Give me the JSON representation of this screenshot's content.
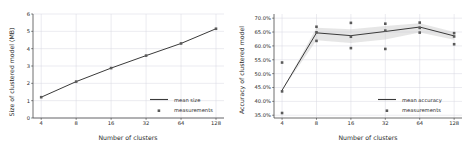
{
  "figure": {
    "background": "#ffffff",
    "line_color": "#3a3a3a",
    "marker_color": "#5a5a5a",
    "grid_color": "#d6d6e0",
    "axis_color": "#4a4a4a",
    "band_color": "#c8c8c8"
  },
  "chart_data": [
    {
      "type": "line",
      "id": "size-chart",
      "title": "",
      "xlabel": "Number of clusters",
      "ylabel": "Size of clustered model (MB)",
      "x": [
        4,
        8,
        16,
        32,
        64,
        128
      ],
      "xtick_labels": [
        "4",
        "8",
        "16",
        "32",
        "64",
        "128"
      ],
      "xscale": "log2",
      "xlim": [
        3.4,
        150
      ],
      "ylim": [
        0,
        6
      ],
      "ytick_labels": [
        "0",
        "1",
        "2",
        "3",
        "4",
        "5",
        "6"
      ],
      "ytick_values": [
        0,
        1,
        2,
        3,
        4,
        5,
        6
      ],
      "grid": true,
      "legend_position": "lower right",
      "series": [
        {
          "name": "mean size",
          "style": "line",
          "values": [
            1.2,
            2.1,
            2.88,
            3.6,
            4.3,
            5.15
          ]
        },
        {
          "name": "measurements",
          "style": "scatter",
          "values": [
            1.2,
            2.1,
            2.88,
            3.6,
            4.3,
            5.15
          ]
        }
      ]
    },
    {
      "type": "line",
      "id": "accuracy-chart",
      "title": "",
      "xlabel": "Number of clusters",
      "ylabel": "Accuracy of clustered model",
      "x": [
        4,
        8,
        16,
        32,
        64,
        128
      ],
      "xtick_labels": [
        "4",
        "8",
        "16",
        "32",
        "64",
        "128"
      ],
      "xscale": "log2",
      "xlim": [
        3.4,
        150
      ],
      "ylim": [
        34.0,
        71.5
      ],
      "ytick_labels": [
        "35.0%",
        "40.0%",
        "45.0%",
        "50.0%",
        "55.0%",
        "60.0%",
        "65.0%",
        "70.0%"
      ],
      "ytick_values": [
        35,
        40,
        45,
        50,
        55,
        60,
        65,
        70
      ],
      "grid": true,
      "legend_position": "lower right",
      "series": [
        {
          "name": "mean accuracy",
          "style": "line",
          "values": [
            44.0,
            64.7,
            63.7,
            65.2,
            66.8,
            63.6
          ]
        },
        {
          "name": "measurements",
          "style": "scatter",
          "points": [
            {
              "x": 4,
              "y": 35.8
            },
            {
              "x": 4,
              "y": 43.6
            },
            {
              "x": 4,
              "y": 54.0
            },
            {
              "x": 8,
              "y": 61.8
            },
            {
              "x": 8,
              "y": 64.9
            },
            {
              "x": 8,
              "y": 66.9
            },
            {
              "x": 16,
              "y": 59.2
            },
            {
              "x": 16,
              "y": 63.3
            },
            {
              "x": 16,
              "y": 68.3
            },
            {
              "x": 32,
              "y": 58.9
            },
            {
              "x": 32,
              "y": 65.5
            },
            {
              "x": 32,
              "y": 68.0
            },
            {
              "x": 64,
              "y": 64.8
            },
            {
              "x": 64,
              "y": 66.5
            },
            {
              "x": 64,
              "y": 68.4
            },
            {
              "x": 128,
              "y": 60.6
            },
            {
              "x": 128,
              "y": 63.4
            },
            {
              "x": 128,
              "y": 64.6
            }
          ]
        }
      ],
      "band": {
        "name": "confidence band",
        "lower": [
          44.0,
          62.0,
          61.0,
          62.3,
          64.8,
          62.2
        ],
        "upper": [
          44.0,
          66.5,
          66.0,
          67.2,
          68.2,
          65.0
        ]
      }
    }
  ]
}
